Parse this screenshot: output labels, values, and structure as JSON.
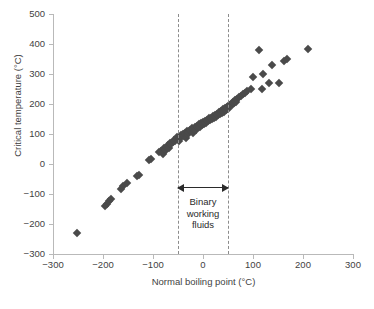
{
  "chart_data": {
    "type": "scatter",
    "title": "",
    "xlabel": "Normal boiling point (°C)",
    "ylabel": "Critical temperature (°C)",
    "xlim": [
      -300,
      300
    ],
    "ylim": [
      -300,
      500
    ],
    "xticks": [
      -300,
      -200,
      -100,
      0,
      100,
      200,
      300
    ],
    "yticks": [
      -300,
      -200,
      -100,
      0,
      100,
      200,
      300,
      400,
      500
    ],
    "xtick_labels": [
      "-300",
      "-200",
      "-100",
      "0",
      "100",
      "200",
      "300"
    ],
    "ytick_labels": [
      "-300",
      "-200",
      "-100",
      "0",
      "100",
      "200",
      "300",
      "400",
      "500"
    ],
    "grid": false,
    "legend": null,
    "marker": "diamond",
    "marker_color": "#4a4a4a",
    "annotations": [
      {
        "name": "binary-working-fluids-region",
        "label": "Binary\nworking\nfluids",
        "label_lines": [
          "Binary",
          "working",
          "fluids"
        ],
        "x_range": [
          -50,
          50
        ],
        "style": "dashed vertical bounds with double-headed arrow"
      }
    ],
    "points": [
      [
        -253,
        -230
      ],
      [
        -196,
        -140
      ],
      [
        -192,
        -132
      ],
      [
        -188,
        -122
      ],
      [
        -185,
        -118
      ],
      [
        -165,
        -82
      ],
      [
        -161,
        -72
      ],
      [
        -152,
        -64
      ],
      [
        -132,
        -40
      ],
      [
        -128,
        -38
      ],
      [
        -108,
        15
      ],
      [
        -104,
        18
      ],
      [
        -88,
        40
      ],
      [
        -84,
        44
      ],
      [
        -80,
        32
      ],
      [
        -78,
        52
      ],
      [
        -75,
        48
      ],
      [
        -72,
        58
      ],
      [
        -70,
        62
      ],
      [
        -68,
        55
      ],
      [
        -66,
        70
      ],
      [
        -64,
        66
      ],
      [
        -60,
        72
      ],
      [
        -58,
        80
      ],
      [
        -56,
        76
      ],
      [
        -54,
        84
      ],
      [
        -52,
        90
      ],
      [
        -48,
        78
      ],
      [
        -46,
        88
      ],
      [
        -44,
        96
      ],
      [
        -42,
        92
      ],
      [
        -40,
        100
      ],
      [
        -38,
        95
      ],
      [
        -36,
        104
      ],
      [
        -34,
        86
      ],
      [
        -32,
        110
      ],
      [
        -30,
        100
      ],
      [
        -28,
        108
      ],
      [
        -26,
        115
      ],
      [
        -24,
        112
      ],
      [
        -22,
        120
      ],
      [
        -20,
        105
      ],
      [
        -18,
        118
      ],
      [
        -16,
        124
      ],
      [
        -14,
        113
      ],
      [
        -12,
        128
      ],
      [
        -10,
        122
      ],
      [
        -8,
        132
      ],
      [
        -6,
        125
      ],
      [
        -4,
        136
      ],
      [
        -2,
        130
      ],
      [
        0,
        140
      ],
      [
        2,
        134
      ],
      [
        4,
        144
      ],
      [
        6,
        138
      ],
      [
        8,
        148
      ],
      [
        10,
        142
      ],
      [
        12,
        152
      ],
      [
        14,
        146
      ],
      [
        16,
        155
      ],
      [
        18,
        150
      ],
      [
        20,
        160
      ],
      [
        22,
        154
      ],
      [
        24,
        164
      ],
      [
        26,
        158
      ],
      [
        28,
        168
      ],
      [
        30,
        162
      ],
      [
        32,
        172
      ],
      [
        34,
        166
      ],
      [
        36,
        176
      ],
      [
        38,
        170
      ],
      [
        40,
        182
      ],
      [
        42,
        175
      ],
      [
        44,
        186
      ],
      [
        46,
        180
      ],
      [
        48,
        190
      ],
      [
        50,
        185
      ],
      [
        52,
        196
      ],
      [
        54,
        192
      ],
      [
        56,
        200
      ],
      [
        58,
        198
      ],
      [
        60,
        206
      ],
      [
        62,
        202
      ],
      [
        64,
        212
      ],
      [
        66,
        208
      ],
      [
        68,
        216
      ],
      [
        72,
        222
      ],
      [
        76,
        228
      ],
      [
        80,
        234
      ],
      [
        84,
        238
      ],
      [
        88,
        244
      ],
      [
        96,
        250
      ],
      [
        100,
        290
      ],
      [
        112,
        380
      ],
      [
        118,
        250
      ],
      [
        120,
        300
      ],
      [
        132,
        270
      ],
      [
        138,
        330
      ],
      [
        152,
        270
      ],
      [
        162,
        345
      ],
      [
        168,
        350
      ],
      [
        210,
        385
      ]
    ]
  }
}
